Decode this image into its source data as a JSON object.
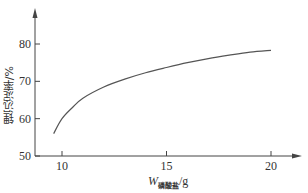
{
  "chart_data": {
    "type": "line",
    "title": "",
    "xlabel": "W磷酸盐/g",
    "xlabel_main": "W",
    "xlabel_sub": "磷酸盐",
    "xlabel_unit": "/g",
    "ylabel": "锂沉淀率/%",
    "xlim": [
      8.6,
      21.5
    ],
    "ylim": [
      50,
      88
    ],
    "x_ticks": [
      10,
      15,
      20
    ],
    "y_ticks": [
      50,
      60,
      70,
      80
    ],
    "grid": false,
    "legend": null,
    "series": [
      {
        "name": "锂沉淀率",
        "color": "#555555",
        "x": [
          9.6,
          10.0,
          10.5,
          11,
          12,
          13,
          14,
          15,
          16,
          17,
          18,
          19,
          20
        ],
        "y": [
          56.0,
          60.0,
          63.0,
          65.5,
          68.5,
          70.6,
          72.3,
          73.7,
          75.0,
          76.1,
          77.0,
          77.8,
          78.3
        ]
      }
    ]
  }
}
